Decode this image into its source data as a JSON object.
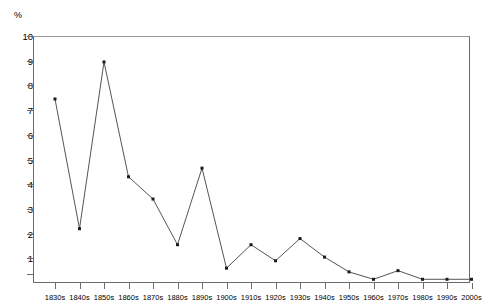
{
  "chart_data": {
    "type": "line",
    "title": "",
    "xlabel": "",
    "ylabel": "%",
    "ylim": [
      0,
      10
    ],
    "yticks": [
      1,
      2,
      3,
      4,
      5,
      6,
      7,
      8,
      9,
      10
    ],
    "grid": false,
    "legend": null,
    "categories": [
      "1830s",
      "1840s",
      "1850s",
      "1860s",
      "1870s",
      "1880s",
      "1890s",
      "1900s",
      "1910s",
      "1920s",
      "1930s",
      "1940s",
      "1950s",
      "1960s",
      "1970s",
      "1980s",
      "1990s",
      "2000s"
    ],
    "values": [
      7.45,
      2.2,
      8.95,
      4.3,
      3.4,
      1.55,
      4.65,
      0.6,
      1.55,
      0.9,
      1.8,
      1.05,
      0.45,
      0.15,
      0.5,
      0.15,
      0.15,
      0.15
    ],
    "series": [
      {
        "name": "percent",
        "color": "#555555",
        "marker": "square",
        "values": [
          7.45,
          2.2,
          8.95,
          4.3,
          3.4,
          1.55,
          4.65,
          0.6,
          1.55,
          0.9,
          1.8,
          1.05,
          0.45,
          0.15,
          0.5,
          0.15,
          0.15,
          0.15
        ]
      }
    ]
  },
  "axes": {
    "unit_label": "%",
    "y_tick_labels": [
      "10",
      "9",
      "8",
      "7",
      "6",
      "5",
      "4",
      "3",
      "2",
      "1"
    ]
  },
  "colors": {
    "line": "#555555",
    "marker": "#1a1a1a",
    "axis": "#6b6b6b",
    "frame_top": "#9a9a9a",
    "background": "#ffffff"
  }
}
